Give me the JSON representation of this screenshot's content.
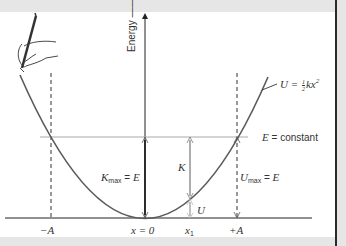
{
  "diagram": {
    "axis": {
      "y_label": "Energy"
    },
    "ticks": {
      "neg_amplitude": "−A",
      "origin": "x = 0",
      "x1": "x",
      "x1_sub": "1",
      "pos_amplitude": "+A"
    },
    "curve_label": {
      "prefix": "U =",
      "frac_num": "1",
      "frac_den": "2",
      "suffix": "kx",
      "exp": "2"
    },
    "energy_line_label": {
      "var": "E",
      "text": " = constant"
    },
    "kmax_label": {
      "var": "K",
      "sub": "max",
      "text": " = ",
      "rhs": "E"
    },
    "k_label": "K",
    "u_label": "U",
    "umax_label": {
      "var": "U",
      "sub": "max",
      "text": " = ",
      "rhs": "E"
    },
    "colors": {
      "curve": "#5a5a5a",
      "energy_line": "#a8a8a8",
      "axis": "#222222",
      "u_arrow": "#b8b8b8",
      "background": "#ffffff",
      "frame": "#e6e6e6"
    }
  }
}
